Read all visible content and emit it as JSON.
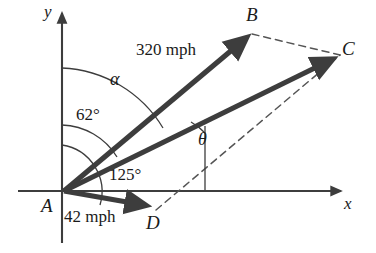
{
  "figure": {
    "type": "vector-diagram",
    "colors": {
      "vector": "#3d3d3d",
      "axis": "#3d3d3d",
      "arc": "#3d3d3d",
      "dashed": "#555555",
      "text": "#1a1a1a",
      "background": "#ffffff"
    }
  },
  "axes": {
    "x_label": "x",
    "y_label": "y",
    "origin_label": "A"
  },
  "points": {
    "A": "A",
    "B": "B",
    "C": "C",
    "D": "D"
  },
  "vectors": [
    {
      "name": "AB",
      "label": "320 mph",
      "from": "A",
      "to": "B",
      "style": "solid-thick"
    },
    {
      "name": "AC",
      "label": "",
      "from": "A",
      "to": "C",
      "style": "solid-thick"
    },
    {
      "name": "AD",
      "label": "42 mph",
      "from": "A",
      "to": "D",
      "style": "solid-thick"
    }
  ],
  "magnitudes": {
    "ab": "320 mph",
    "ad": "42 mph"
  },
  "angles": [
    {
      "name": "alpha",
      "label": "α",
      "vertex": "A",
      "from": "y-axis",
      "to": "AB"
    },
    {
      "name": "bearing",
      "label": "62°",
      "vertex": "A",
      "from": "y-axis",
      "to": "AC"
    },
    {
      "name": "wind",
      "label": "125°",
      "vertex": "A",
      "from": "y-axis",
      "to": "AD"
    },
    {
      "name": "theta",
      "label": "θ",
      "vertex": "on-AC",
      "from": "vertical",
      "to": "AC"
    }
  ],
  "dashed_segments": [
    {
      "name": "BC",
      "from": "B",
      "to": "C"
    },
    {
      "name": "AD-extended-to-C",
      "from": "A",
      "to": "C"
    }
  ]
}
